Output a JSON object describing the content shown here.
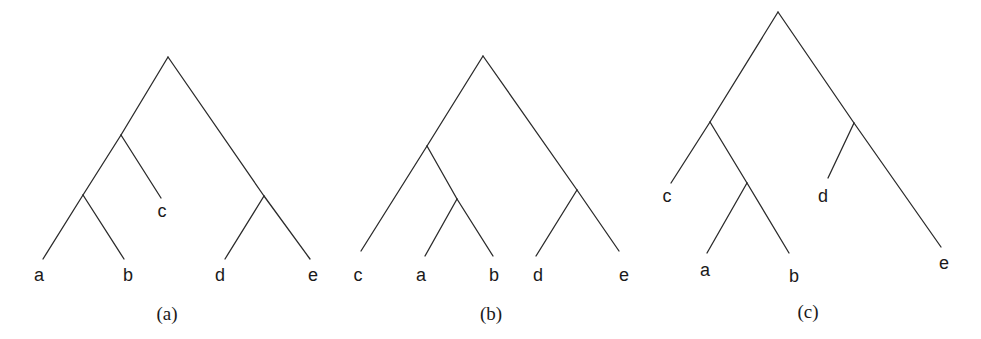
{
  "figure": {
    "style": {
      "line_color": "#2b2b2b",
      "text_color": "#1a1a1a",
      "background": "#ffffff"
    },
    "trees": [
      {
        "caption": "(a)",
        "newick": "(((a,b),c),(d,e))",
        "leaves": [
          {
            "label": "a",
            "x": 39,
            "y": 281
          },
          {
            "label": "b",
            "x": 128,
            "y": 281
          },
          {
            "label": "c",
            "x": 162,
            "y": 217
          },
          {
            "label": "d",
            "x": 220,
            "y": 281
          },
          {
            "label": "e",
            "x": 313,
            "y": 281
          }
        ],
        "caption_pos": {
          "x": 167,
          "y": 320
        },
        "edges": [
          [
            168,
            57,
            121,
            135
          ],
          [
            121,
            135,
            83,
            195
          ],
          [
            83,
            195,
            43,
            259
          ],
          [
            83,
            195,
            124,
            259
          ],
          [
            121,
            135,
            161,
            198
          ],
          [
            168,
            57,
            264,
            196
          ],
          [
            264,
            196,
            225,
            259
          ],
          [
            264,
            196,
            310,
            259
          ]
        ]
      },
      {
        "caption": "(b)",
        "newick": "((c,(a,b)),(d,e))",
        "leaves": [
          {
            "label": "c",
            "x": 358,
            "y": 281
          },
          {
            "label": "a",
            "x": 421,
            "y": 281
          },
          {
            "label": "b",
            "x": 494,
            "y": 281
          },
          {
            "label": "d",
            "x": 538,
            "y": 281
          },
          {
            "label": "e",
            "x": 624,
            "y": 281
          }
        ],
        "caption_pos": {
          "x": 491,
          "y": 320
        },
        "edges": [
          [
            483,
            56,
            427,
            146
          ],
          [
            427,
            146,
            361,
            251
          ],
          [
            427,
            146,
            457,
            199
          ],
          [
            457,
            199,
            425,
            256
          ],
          [
            457,
            199,
            493,
            256
          ],
          [
            483,
            56,
            577,
            190
          ],
          [
            577,
            190,
            536,
            256
          ],
          [
            577,
            190,
            619,
            251
          ]
        ]
      },
      {
        "caption": "(c)",
        "newick": "((c,(a,b)),(d,e))",
        "leaves": [
          {
            "label": "c",
            "x": 667,
            "y": 202
          },
          {
            "label": "a",
            "x": 705,
            "y": 276
          },
          {
            "label": "b",
            "x": 794,
            "y": 282
          },
          {
            "label": "d",
            "x": 823,
            "y": 202
          },
          {
            "label": "e",
            "x": 944,
            "y": 269
          }
        ],
        "caption_pos": {
          "x": 808,
          "y": 318
        },
        "edges": [
          [
            778,
            12,
            710,
            122
          ],
          [
            710,
            122,
            671,
            183
          ],
          [
            710,
            122,
            747,
            183
          ],
          [
            747,
            183,
            707,
            253
          ],
          [
            747,
            183,
            789,
            253
          ],
          [
            778,
            12,
            854,
            123
          ],
          [
            854,
            123,
            828,
            178
          ],
          [
            854,
            123,
            941,
            247
          ]
        ]
      }
    ]
  }
}
